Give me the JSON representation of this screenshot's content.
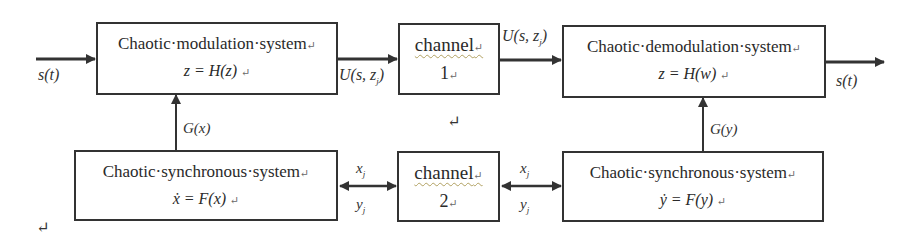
{
  "diagram": {
    "type": "block-diagram",
    "blocks": {
      "modulation": {
        "title": "Chaotic·modulation·system",
        "equation": "z = H(z)",
        "para_mark": "↵"
      },
      "channel1": {
        "title": "channel",
        "number": "1",
        "para_mark": "↵"
      },
      "demodulation": {
        "title": "Chaotic·demodulation·system",
        "equation": "z = H(w)",
        "para_mark": "↵"
      },
      "sync_left": {
        "title": "Chaotic·synchronous·system",
        "equation": "ẋ = F(x)",
        "para_mark": "↵"
      },
      "channel2": {
        "title": "channel",
        "number": "2",
        "para_mark": "↵"
      },
      "sync_right": {
        "title": "Chaotic·synchronous·system",
        "equation": "ẏ = F(y)",
        "para_mark": "↵"
      }
    },
    "labels": {
      "input_signal": "s(t)",
      "output_signal": "s(t)",
      "modulated_out": "U(s, z",
      "modulated_out_sub": "j",
      "channel1_out": "U(s, z",
      "channel1_out_sub": "j",
      "g_x": "G(x)",
      "g_y": "G(y)",
      "x_left": "x",
      "y_left": "y",
      "x_right": "x",
      "y_right": "y",
      "sub_j": "j",
      "stray_mark_1": "↵",
      "stray_mark_2": "↵"
    },
    "colors": {
      "line": "#333333",
      "text": "#2a2a2a",
      "background": "#ffffff"
    }
  }
}
